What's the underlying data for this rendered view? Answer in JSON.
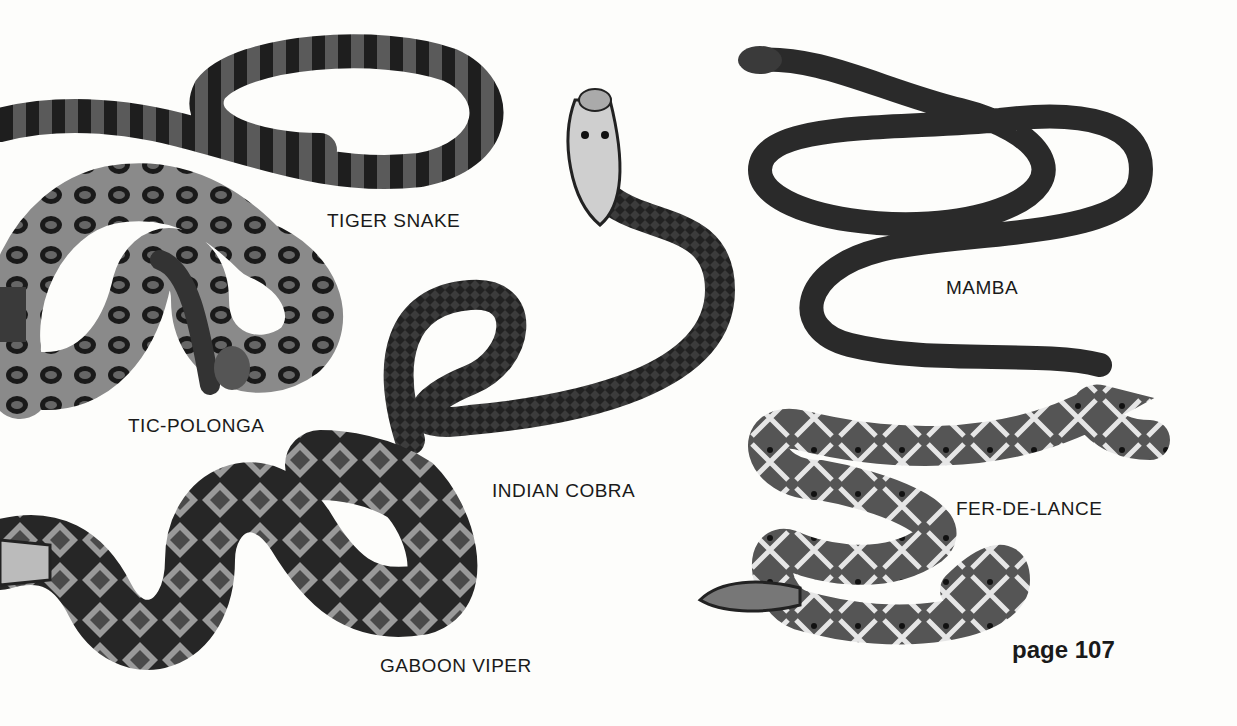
{
  "page": {
    "number_label": "page 107"
  },
  "snakes": [
    {
      "name": "TIGER SNAKE"
    },
    {
      "name": "TIC-POLONGA"
    },
    {
      "name": "INDIAN COBRA"
    },
    {
      "name": "MAMBA"
    },
    {
      "name": "FER-DE-LANCE"
    },
    {
      "name": "GABOON VIPER"
    }
  ]
}
